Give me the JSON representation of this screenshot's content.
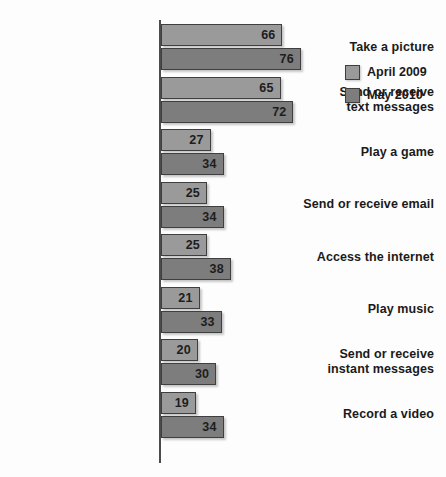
{
  "chart_data": {
    "type": "bar",
    "orientation": "horizontal",
    "title": "",
    "subtitle": "",
    "xlabel": "",
    "ylabel": "",
    "grid": false,
    "xlim": [
      0,
      80
    ],
    "legend_position": "right",
    "categories": [
      "Take a picture",
      "Send or receive text messages",
      "Play a game",
      "Send or receive email",
      "Access the internet",
      "Play music",
      "Send or receive instant messages",
      "Record a video"
    ],
    "category_lines": [
      [
        "Take a picture"
      ],
      [
        "Send or receive",
        "text messages"
      ],
      [
        "Play a game"
      ],
      [
        "Send or receive email"
      ],
      [
        "Access the internet"
      ],
      [
        "Play music"
      ],
      [
        "Send or receive",
        "instant messages"
      ],
      [
        "Record a video"
      ]
    ],
    "series": [
      {
        "name": "April 2009",
        "color": "#9a9a9a",
        "values": [
          66,
          65,
          27,
          25,
          25,
          21,
          20,
          19
        ]
      },
      {
        "name": "May 2010",
        "color": "#7d7d7d",
        "values": [
          76,
          72,
          34,
          34,
          38,
          33,
          30,
          34
        ]
      }
    ]
  },
  "legend": {
    "items": [
      {
        "label": "April 2009",
        "color": "#9a9a9a"
      },
      {
        "label": "May 2010",
        "color": "#7d7d7d"
      }
    ]
  },
  "style": {
    "background": "#fdfdfd",
    "axis_color": "#4b4b4b",
    "bar_border": "#3f3f3f",
    "text_color": "#1a1a1a"
  }
}
